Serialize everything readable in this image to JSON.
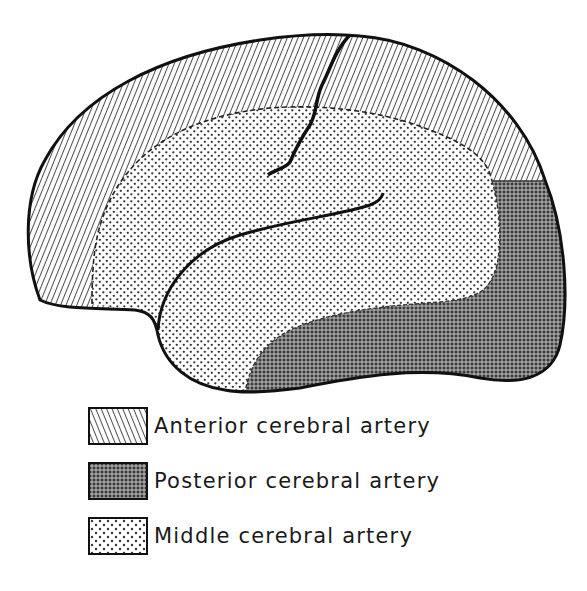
{
  "figure": {
    "regions": [
      {
        "id": "anterior",
        "territory": "Anterior cerebral artery",
        "pattern": "diagonal-hatch"
      },
      {
        "id": "posterior",
        "territory": "Posterior cerebral artery",
        "pattern": "cross-hatch"
      },
      {
        "id": "middle",
        "territory": "Middle cerebral artery",
        "pattern": "dots"
      }
    ],
    "colors": {
      "ink": "#111111",
      "background": "#ffffff"
    }
  },
  "legend": {
    "items": [
      {
        "label": "Anterior cerebral artery",
        "pattern": "diagonal-hatch"
      },
      {
        "label": "Posterior cerebral artery",
        "pattern": "cross-hatch"
      },
      {
        "label": "Middle cerebral artery",
        "pattern": "dots"
      }
    ]
  }
}
